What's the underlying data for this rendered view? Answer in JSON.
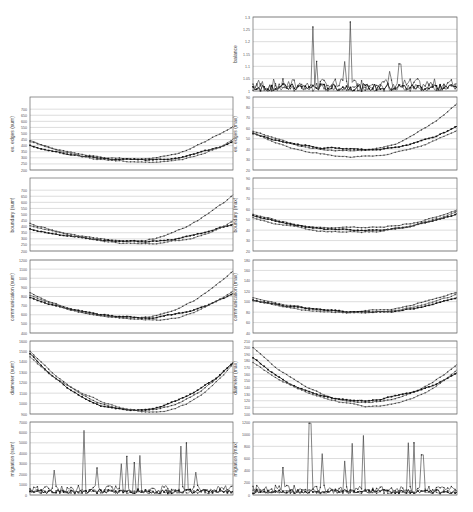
{
  "chart_data": [
    {
      "id": "balance",
      "type": "line",
      "ylabel": "balance",
      "ylim": [
        1,
        1.3
      ],
      "yticks": [
        "1",
        "1.05",
        "1.1",
        "1.15",
        "1.2",
        "1.25",
        "1.3"
      ],
      "grid": true,
      "legend": "none",
      "series_count": 3,
      "notes": "Mostly near 1.0-1.05, with spikes to ~1.26 and ~1.28, smaller spikes ~1.12, ~1.09, ~1.11",
      "spikes": [
        {
          "pos": 0.29,
          "value": 1.26
        },
        {
          "pos": 0.31,
          "value": 1.12
        },
        {
          "pos": 0.45,
          "value": 1.12
        },
        {
          "pos": 0.48,
          "value": 1.28
        },
        {
          "pos": 0.67,
          "value": 1.08
        },
        {
          "pos": 0.72,
          "value": 1.11
        }
      ]
    },
    {
      "id": "ex-edges-sum",
      "type": "line",
      "ylabel": "ex. edges (sum)",
      "ylim": [
        200,
        800
      ],
      "yticks": [
        "200",
        "250",
        "300",
        "350",
        "400",
        "450",
        "500",
        "550",
        "600",
        "650",
        "700"
      ],
      "grid": true,
      "series_count": 3,
      "shape": "U-shaped; starts ~440-470, minimum ~280 mid, rises to ~650 at end for upper series"
    },
    {
      "id": "ex-edges-max",
      "type": "line",
      "ylabel": "ex. edges (max)",
      "ylim": [
        20,
        90
      ],
      "yticks": [
        "20",
        "30",
        "40",
        "50",
        "60",
        "70",
        "80",
        "90"
      ],
      "grid": true,
      "series_count": 3,
      "shape": "starts ~55-60, dip ~35 mid, rises to ~85 peak near end"
    },
    {
      "id": "boundary-sum",
      "type": "line",
      "ylabel": "boundary (sum)",
      "ylim": [
        200,
        800
      ],
      "yticks": [
        "200",
        "250",
        "300",
        "350",
        "400",
        "450",
        "500",
        "550",
        "600",
        "650",
        "700"
      ],
      "grid": true,
      "series_count": 3,
      "shape": "U-shaped; similar to ex. edges (sum)"
    },
    {
      "id": "boundary-max",
      "type": "line",
      "ylabel": "boundary (max)",
      "ylim": [
        20,
        90
      ],
      "yticks": [
        "20",
        "30",
        "40",
        "50",
        "60",
        "70",
        "80",
        "90"
      ],
      "grid": true,
      "series_count": 3,
      "shape": "starts ~55, dip ~40, rises to ~60 at end"
    },
    {
      "id": "communication-sum",
      "type": "line",
      "ylabel": "communication (sum)",
      "ylim": [
        400,
        1200
      ],
      "yticks": [
        "400",
        "500",
        "600",
        "700",
        "800",
        "900",
        "1000",
        "1100",
        "1200"
      ],
      "grid": true,
      "series_count": 3,
      "shape": "U-shaped; starts ~800-880, min ~560, rises to ~1080 at end"
    },
    {
      "id": "communication-max",
      "type": "line",
      "ylabel": "communication (max)",
      "ylim": [
        40,
        180
      ],
      "yticks": [
        "40",
        "60",
        "80",
        "100",
        "120",
        "140",
        "160",
        "180"
      ],
      "grid": true,
      "series_count": 3,
      "shape": "starts ~105-115, dips ~80, rises ~120 at end"
    },
    {
      "id": "diameter-sum",
      "type": "line",
      "ylabel": "diameter (sum)",
      "ylim": [
        900,
        1600
      ],
      "yticks": [
        "900",
        "1000",
        "1100",
        "1200",
        "1300",
        "1400",
        "1500",
        "1600"
      ],
      "grid": true,
      "series_count": 3,
      "shape": "starts ~1500, min ~920 mid, rises to ~1400 at end"
    },
    {
      "id": "diameter-max",
      "type": "line",
      "ylabel": "diameter (max)",
      "ylim": [
        100,
        210
      ],
      "yticks": [
        "100",
        "110",
        "120",
        "130",
        "140",
        "150",
        "160",
        "170",
        "180",
        "190",
        "200",
        "210"
      ],
      "grid": true,
      "series_count": 3,
      "shape": "starts ~200, min ~115 mid, rises to ~175 at end"
    },
    {
      "id": "migration-sum",
      "type": "line",
      "ylabel": "migration (sum)",
      "ylim": [
        0,
        7000
      ],
      "yticks": [
        "0",
        "1000",
        "2000",
        "3000",
        "4000",
        "5000",
        "6000",
        "7000"
      ],
      "grid": true,
      "series_count": 3,
      "notes": "Mostly below 1500 with spikes",
      "spikes": [
        {
          "pos": 0.12,
          "value": 2400
        },
        {
          "pos": 0.27,
          "value": 6200
        },
        {
          "pos": 0.33,
          "value": 2600
        },
        {
          "pos": 0.45,
          "value": 3000
        },
        {
          "pos": 0.48,
          "value": 3700
        },
        {
          "pos": 0.51,
          "value": 3100
        },
        {
          "pos": 0.54,
          "value": 3800
        },
        {
          "pos": 0.74,
          "value": 4700
        },
        {
          "pos": 0.77,
          "value": 5000
        },
        {
          "pos": 0.82,
          "value": 2200
        }
      ]
    },
    {
      "id": "migration-max",
      "type": "line",
      "ylabel": "migration (max)",
      "ylim": [
        0,
        1200
      ],
      "yticks": [
        "0",
        "200",
        "400",
        "600",
        "800",
        "1000",
        "1200"
      ],
      "grid": true,
      "series_count": 3,
      "notes": "Mostly below 300 with spikes",
      "spikes": [
        {
          "pos": 0.15,
          "value": 450
        },
        {
          "pos": 0.28,
          "value": 1180
        },
        {
          "pos": 0.34,
          "value": 680
        },
        {
          "pos": 0.45,
          "value": 560
        },
        {
          "pos": 0.49,
          "value": 850
        },
        {
          "pos": 0.54,
          "value": 980
        },
        {
          "pos": 0.76,
          "value": 860
        },
        {
          "pos": 0.79,
          "value": 860
        },
        {
          "pos": 0.83,
          "value": 660
        }
      ]
    }
  ]
}
